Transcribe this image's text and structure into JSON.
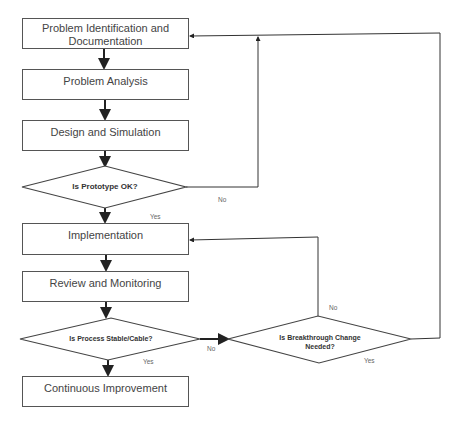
{
  "diagram": {
    "boxes": [
      {
        "id": "problem-identification",
        "label": "Problem Identification and Documentation"
      },
      {
        "id": "problem-analysis",
        "label": "Problem Analysis"
      },
      {
        "id": "design-simulation",
        "label": "Design and Simulation"
      },
      {
        "id": "implementation",
        "label": "Implementation"
      },
      {
        "id": "review-monitoring",
        "label": "Review and Monitoring"
      },
      {
        "id": "continuous-improvement",
        "label": "Continuous Improvement"
      }
    ],
    "decisions": [
      {
        "id": "prototype-ok",
        "label": "Is Prototype OK?"
      },
      {
        "id": "process-stable",
        "label": "Is Process Stable/Cable?"
      },
      {
        "id": "breakthrough-change",
        "label": "Is Breakthrough Change Needed?"
      }
    ],
    "edge_labels": {
      "prototype_no": "No",
      "prototype_yes": "Yes",
      "process_no": "No",
      "process_yes": "Yes",
      "breakthrough_no": "No",
      "breakthrough_yes": "Yes"
    },
    "colors": {
      "line": "#222222",
      "box_border": "#555555",
      "text": "#444444"
    }
  }
}
